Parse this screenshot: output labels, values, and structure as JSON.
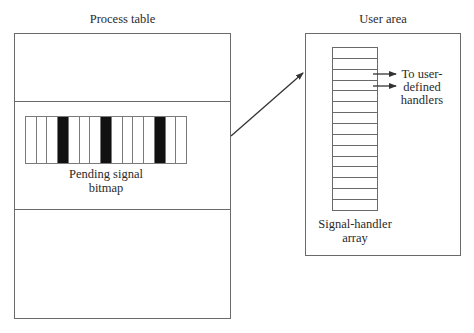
{
  "process_table": {
    "title": "Process table",
    "bitmap_label_line1": "Pending signal",
    "bitmap_label_line2": "bitmap",
    "bitmap": {
      "cell_count": 15,
      "set_bits": [
        3,
        7,
        12
      ],
      "set_color": "#111111",
      "clear_color": "#ffffff"
    }
  },
  "user_area": {
    "title": "User area",
    "array_label_line1": "Signal-handler",
    "array_label_line2": "array",
    "array_rows": 15,
    "handler_note_line1": "To user-",
    "handler_note_line2": "defined",
    "handler_note_line3": "handlers",
    "handler_arrow_rows": [
      2,
      3
    ]
  },
  "connector": {
    "from": "process-table-bitmap-slot",
    "to": "user-area"
  },
  "colors": {
    "line": "#6a6a6a",
    "arrow": "#333333",
    "text": "#2a2a2a"
  }
}
